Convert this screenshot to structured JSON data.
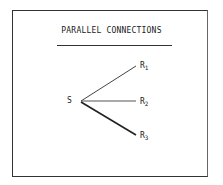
{
  "diagram": {
    "title": "PARALLEL CONNECTIONS",
    "source": {
      "label": "S"
    },
    "targets": [
      {
        "label": "R",
        "subscript": "1"
      },
      {
        "label": "R",
        "subscript": "2"
      },
      {
        "label": "R",
        "subscript": "3"
      }
    ],
    "edges": [
      {
        "from": "S",
        "to": "R1"
      },
      {
        "from": "S",
        "to": "R2"
      },
      {
        "from": "S",
        "to": "R3"
      }
    ]
  }
}
